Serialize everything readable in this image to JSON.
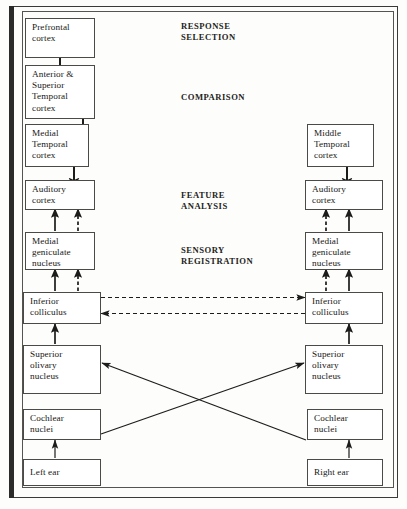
{
  "figure": {
    "top_cut_text": "",
    "stage_labels": [
      {
        "id": "response-selection",
        "line1": "RESPONSE",
        "line2": "SELECTION"
      },
      {
        "id": "comparison",
        "line1": "COMPARISON",
        "line2": ""
      },
      {
        "id": "feature-analysis",
        "line1": "FEATURE",
        "line2": "ANALYSIS"
      },
      {
        "id": "sensory-registration",
        "line1": "SENSORY",
        "line2": "REGISTRATION"
      }
    ],
    "left_column": {
      "name": "left-pathway",
      "nodes": [
        {
          "id": "prefrontal-cortex",
          "line1": "Prefrontal",
          "line2": "cortex",
          "line3": "",
          "line4": ""
        },
        {
          "id": "anterior-superior-temporal-cortex",
          "line1": "Anterior &",
          "line2": "Superior",
          "line3": "Temporal",
          "line4": "cortex"
        },
        {
          "id": "medial-temporal-cortex",
          "line1": "Medial",
          "line2": "Temporal",
          "line3": "cortex",
          "line4": ""
        },
        {
          "id": "auditory-cortex",
          "line1": "Auditory",
          "line2": "cortex",
          "line3": "",
          "line4": ""
        },
        {
          "id": "medial-geniculate-nucleus",
          "line1": "Medial",
          "line2": "geniculate",
          "line3": "nucleus",
          "line4": ""
        },
        {
          "id": "inferior-colliculus",
          "line1": "Inferior",
          "line2": "colliculus",
          "line3": "",
          "line4": ""
        },
        {
          "id": "superior-olivary-nucleus",
          "line1": "Superior",
          "line2": "olivary",
          "line3": "nucleus",
          "line4": ""
        },
        {
          "id": "cochlear-nuclei",
          "line1": "Cochlear",
          "line2": "nuclei",
          "line3": "",
          "line4": ""
        },
        {
          "id": "left-ear",
          "line1": "Left ear",
          "line2": "",
          "line3": "",
          "line4": ""
        }
      ]
    },
    "right_column": {
      "name": "right-pathway",
      "nodes": [
        {
          "id": "middle-temporal-cortex",
          "line1": "Middle",
          "line2": "Temporal",
          "line3": "cortex",
          "line4": ""
        },
        {
          "id": "auditory-cortex",
          "line1": "Auditory",
          "line2": "cortex",
          "line3": "",
          "line4": ""
        },
        {
          "id": "medial-geniculate-nucleus",
          "line1": "Medial",
          "line2": "geniculate",
          "line3": "nucleus",
          "line4": ""
        },
        {
          "id": "inferior-colliculus",
          "line1": "Inferior",
          "line2": "colliculus",
          "line3": "",
          "line4": ""
        },
        {
          "id": "superior-olivary-nucleus",
          "line1": "Superior",
          "line2": "olivary",
          "line3": "nucleus",
          "line4": ""
        },
        {
          "id": "cochlear-nuclei",
          "line1": "Cochlear",
          "line2": "nuclei",
          "line3": "",
          "line4": ""
        },
        {
          "id": "right-ear",
          "line1": "Right ear",
          "line2": "",
          "line3": "",
          "line4": ""
        }
      ]
    },
    "colors": {
      "line": "#1c1c1a",
      "box_border": "#4a4a47",
      "frame": "#3a3a38",
      "spine": "#2b2b29",
      "text": "#171716",
      "page": "#fdfdfb"
    }
  }
}
